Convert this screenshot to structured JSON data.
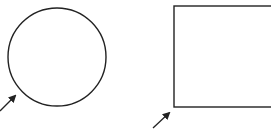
{
  "diagram": {
    "background": "#ffffff",
    "stroke_color": "#222222",
    "shapes": [
      {
        "type": "circle",
        "label": "circle",
        "cx": 57,
        "cy": 57,
        "r": 49
      },
      {
        "type": "rectangle",
        "label": "square",
        "x": 174,
        "y": 6,
        "width": 110,
        "height": 101
      }
    ],
    "arrows": [
      {
        "target": "circle",
        "x1": 0,
        "y1": 111,
        "x2": 15,
        "y2": 96
      },
      {
        "target": "square",
        "x1": 153,
        "y1": 128,
        "x2": 169,
        "y2": 113
      }
    ]
  }
}
